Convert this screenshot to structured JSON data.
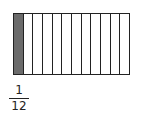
{
  "diagram": {
    "type": "fraction-bar",
    "total_parts": 12,
    "shaded_parts": 1,
    "shaded_color": "#6b6b6b",
    "outline_color": "#222222"
  },
  "fraction": {
    "numerator": "1",
    "denominator": "12"
  }
}
